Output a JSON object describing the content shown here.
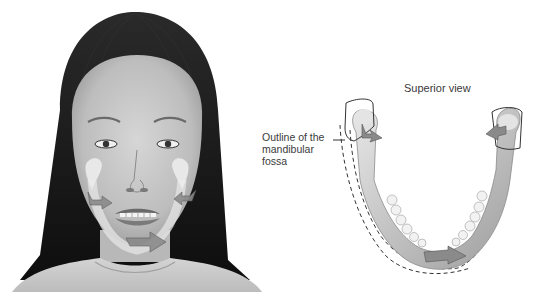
{
  "figure": {
    "left_panel": {
      "subject": "frontal view of face with mandible overlay",
      "arrows": [
        "left-condyle-arrow",
        "right-condyle-arrow",
        "chin-arrow"
      ]
    },
    "right_panel": {
      "title": "Superior view",
      "callout": {
        "lines": [
          "Outline of the",
          "mandibular",
          "fossa"
        ]
      }
    },
    "colors": {
      "background": "#ffffff",
      "hair": "#1a1a1a",
      "skin": "#c8c8c8",
      "bone": "#dcdcdc",
      "arrow": "#8a8a8a",
      "text": "#3a3a3a",
      "outline": "#333333"
    }
  }
}
